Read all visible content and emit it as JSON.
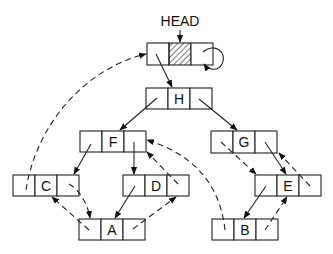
{
  "diagram": {
    "head_label": "HEAD",
    "nodes": [
      {
        "id": "head",
        "label": "",
        "x": 147,
        "y": 43,
        "hatched": true
      },
      {
        "id": "H",
        "label": "H",
        "x": 146,
        "y": 88
      },
      {
        "id": "F",
        "label": "F",
        "x": 80,
        "y": 131
      },
      {
        "id": "G",
        "label": "G",
        "x": 211,
        "y": 131
      },
      {
        "id": "C",
        "label": "C",
        "x": 13,
        "y": 175
      },
      {
        "id": "D",
        "label": "D",
        "x": 123,
        "y": 175
      },
      {
        "id": "E",
        "label": "E",
        "x": 255,
        "y": 175
      },
      {
        "id": "A",
        "label": "A",
        "x": 79,
        "y": 219
      },
      {
        "id": "B",
        "label": "B",
        "x": 212,
        "y": 219
      }
    ],
    "child_links": [
      {
        "from": "head",
        "to": "H",
        "style": "solid"
      },
      {
        "from": "H",
        "to": "F",
        "style": "solid"
      },
      {
        "from": "H",
        "to": "G",
        "style": "solid"
      },
      {
        "from": "F",
        "to": "C",
        "style": "solid"
      },
      {
        "from": "F",
        "to": "D",
        "style": "solid"
      },
      {
        "from": "G",
        "to": "E",
        "style": "solid"
      },
      {
        "from": "D",
        "to": "A",
        "style": "solid"
      },
      {
        "from": "E",
        "to": "B",
        "style": "solid"
      }
    ],
    "thread_links": [
      {
        "from": "C",
        "to": "head",
        "style": "dashed"
      },
      {
        "from": "C",
        "to": "A",
        "style": "dashed"
      },
      {
        "from": "A",
        "to": "C",
        "style": "dashed"
      },
      {
        "from": "A",
        "to": "D",
        "style": "dashed"
      },
      {
        "from": "D",
        "to": "F",
        "style": "dashed"
      },
      {
        "from": "B",
        "to": "F",
        "style": "dashed"
      },
      {
        "from": "B",
        "to": "E",
        "style": "dashed"
      },
      {
        "from": "G",
        "to": "E",
        "style": "dashed"
      },
      {
        "from": "E",
        "to": "G",
        "style": "dashed"
      },
      {
        "from": "head",
        "to": "head",
        "style": "solid-loop"
      }
    ]
  }
}
